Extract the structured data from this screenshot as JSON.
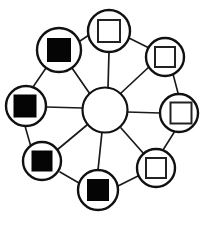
{
  "diagram": {
    "background_color": "#ffffff",
    "line_color": "#1a1a1a",
    "filled_square_color": "#050505",
    "hollow_square_color": "#ffffff",
    "hub": {
      "label": "central-hub",
      "cx": 105,
      "cy": 110,
      "r": 22.5,
      "stroke_width": 2.2,
      "fill": "#ffffff"
    },
    "node_defaults": {
      "circle_r": 20,
      "circle_stroke_width": 2.4,
      "square_size": 21,
      "square_stroke_width": 2.0
    },
    "nodes": [
      {
        "id": "node-top",
        "label": "node-top",
        "cx": 109,
        "cy": 31,
        "circle_r": 21,
        "square_size": 22,
        "square_dx": 0,
        "square_dy": 0,
        "state": "hollow"
      },
      {
        "id": "node-top-right",
        "label": "node-top-right",
        "cx": 165,
        "cy": 57,
        "circle_r": 19,
        "square_size": 20,
        "square_dx": 0,
        "square_dy": 0,
        "state": "hollow"
      },
      {
        "id": "node-right",
        "label": "node-right",
        "cx": 179,
        "cy": 113,
        "circle_r": 19,
        "square_size": 21,
        "square_dx": 2,
        "square_dy": 0,
        "state": "hollow"
      },
      {
        "id": "node-bottom-right",
        "label": "node-bottom-right",
        "cx": 156,
        "cy": 168,
        "circle_r": 19,
        "square_size": 20,
        "square_dx": 0,
        "square_dy": 0,
        "state": "hollow"
      },
      {
        "id": "node-bottom",
        "label": "node-bottom",
        "cx": 98,
        "cy": 190,
        "circle_r": 20,
        "square_size": 21,
        "square_dx": 0,
        "square_dy": 0,
        "state": "filled"
      },
      {
        "id": "node-bottom-left",
        "label": "node-bottom-left",
        "cx": 42,
        "cy": 161,
        "circle_r": 19,
        "square_size": 20,
        "square_dx": 0,
        "square_dy": 0,
        "state": "filled"
      },
      {
        "id": "node-left",
        "label": "node-left",
        "cx": 26,
        "cy": 106,
        "circle_r": 20,
        "square_size": 22,
        "square_dx": -1,
        "square_dy": 0,
        "state": "filled"
      },
      {
        "id": "node-top-left",
        "label": "node-top-left",
        "cx": 59,
        "cy": 50,
        "circle_r": 22,
        "square_size": 23,
        "square_dx": 0,
        "square_dy": 0,
        "state": "filled"
      }
    ],
    "spokes": [
      {
        "id": "spoke-hub-top",
        "from": "central-hub",
        "to": "node-top",
        "x1": 108,
        "y1": 88,
        "x2": 109,
        "y2": 52,
        "width": 1.7
      },
      {
        "id": "spoke-hub-top-right",
        "from": "central-hub",
        "to": "node-top-right",
        "x1": 121,
        "y1": 93,
        "x2": 150,
        "y2": 66,
        "width": 1.7
      },
      {
        "id": "spoke-hub-right",
        "from": "central-hub",
        "to": "node-right",
        "x1": 127,
        "y1": 112,
        "x2": 160,
        "y2": 113,
        "width": 1.7
      },
      {
        "id": "spoke-hub-bottom-right",
        "from": "central-hub",
        "to": "node-bottom-right",
        "x1": 121,
        "y1": 128,
        "x2": 144,
        "y2": 154,
        "width": 1.7
      },
      {
        "id": "spoke-hub-bottom",
        "from": "central-hub",
        "to": "node-bottom",
        "x1": 102,
        "y1": 132,
        "x2": 98,
        "y2": 170,
        "width": 1.7
      },
      {
        "id": "spoke-hub-bottom-left",
        "from": "central-hub",
        "to": "node-bottom-left",
        "x1": 87,
        "y1": 125,
        "x2": 57,
        "y2": 150,
        "width": 1.7
      },
      {
        "id": "spoke-hub-left",
        "from": "central-hub",
        "to": "node-left",
        "x1": 83,
        "y1": 108,
        "x2": 46,
        "y2": 107,
        "width": 1.7
      },
      {
        "id": "spoke-hub-top-left",
        "from": "central-hub",
        "to": "node-top-left",
        "x1": 90,
        "y1": 94,
        "x2": 72,
        "y2": 68,
        "width": 1.7
      }
    ],
    "ring_links": [
      {
        "id": "ring-top-to-top-right",
        "from": "node-top",
        "to": "node-top-right",
        "x1": 129,
        "y1": 38,
        "x2": 149,
        "y2": 48,
        "width": 1.6
      },
      {
        "id": "ring-top-right-to-right",
        "from": "node-top-right",
        "to": "node-right",
        "x1": 173,
        "y1": 74,
        "x2": 178,
        "y2": 93,
        "width": 1.6
      },
      {
        "id": "ring-right-to-bottom-right",
        "from": "node-right",
        "to": "node-bottom-right",
        "x1": 175,
        "y1": 131,
        "x2": 163,
        "y2": 150,
        "width": 1.6
      },
      {
        "id": "ring-bottom-right-to-bottom",
        "from": "node-bottom-right",
        "to": "node-bottom",
        "x1": 138,
        "y1": 176,
        "x2": 118,
        "y2": 186,
        "width": 1.6
      },
      {
        "id": "ring-bottom-to-bottom-left",
        "from": "node-bottom",
        "to": "node-bottom-left",
        "x1": 79,
        "y1": 183,
        "x2": 60,
        "y2": 172,
        "width": 1.6
      },
      {
        "id": "ring-bottom-left-to-left",
        "from": "node-bottom-left",
        "to": "node-left",
        "x1": 31,
        "y1": 147,
        "x2": 25,
        "y2": 126,
        "width": 1.6
      },
      {
        "id": "ring-left-to-top-left",
        "from": "node-left",
        "to": "node-top-left",
        "x1": 33,
        "y1": 87,
        "x2": 46,
        "y2": 68,
        "width": 1.6
      },
      {
        "id": "ring-top-left-to-top",
        "from": "node-top-left",
        "to": "node-top",
        "x1": 80,
        "y1": 41,
        "x2": 89,
        "y2": 35,
        "width": 1.6
      }
    ]
  }
}
